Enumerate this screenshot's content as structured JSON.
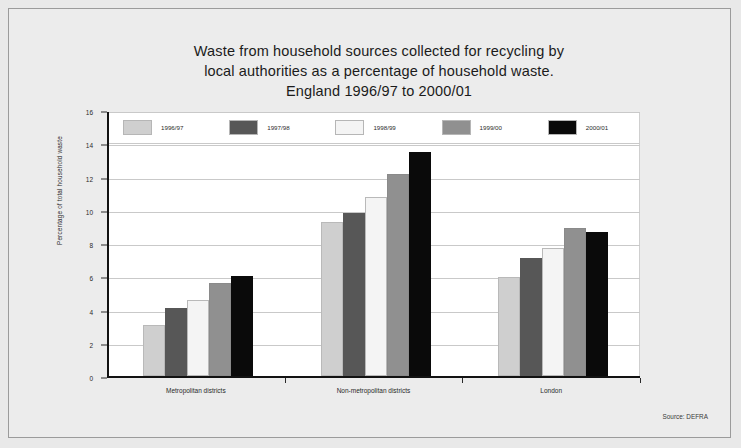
{
  "figure": {
    "title_lines": [
      "Waste from household sources collected for recycling by",
      "local authorities as a percentage of household waste.",
      "England 1996/97 to 2000/01"
    ],
    "source_note": "Source: DEFRA"
  },
  "chart_data": {
    "type": "bar",
    "title": "Waste from household sources collected for recycling by local authorities as a percentage of household waste. England 1996/97 to 2000/01",
    "subtitle": "England 1996/97 to 2000/01",
    "xlabel": "",
    "ylabel": "Percentage of total household waste",
    "ylim": [
      0,
      16
    ],
    "yticks": [
      0,
      2,
      4,
      6,
      8,
      10,
      12,
      14,
      16
    ],
    "ytick_labels": [
      "0",
      "2",
      "4",
      "6",
      "8",
      "10",
      "12",
      "14",
      "16"
    ],
    "grid": true,
    "legend_position": "top-inside",
    "categories": [
      "Metropolitan districts",
      "Non-metropolitan districts",
      "London"
    ],
    "series": [
      {
        "name": "1996/97",
        "color": "#cfcfcf",
        "values": [
          3.05,
          9.25,
          5.95
        ]
      },
      {
        "name": "1997/98",
        "color": "#575757",
        "values": [
          4.1,
          9.8,
          7.1
        ]
      },
      {
        "name": "1998/99",
        "color": "#f4f4f4",
        "values": [
          4.6,
          10.75,
          7.7
        ]
      },
      {
        "name": "1999/00",
        "color": "#909090",
        "values": [
          5.6,
          12.15,
          8.9
        ]
      },
      {
        "name": "2000/01",
        "color": "#0a0a0a",
        "values": [
          6.0,
          13.5,
          8.65
        ]
      }
    ]
  }
}
